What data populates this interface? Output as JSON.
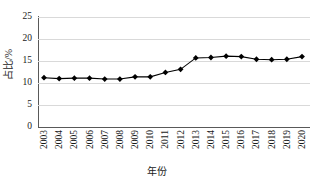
{
  "chart_data": {
    "type": "line",
    "title": "",
    "xlabel": "年份",
    "ylabel": "占比/%",
    "categories": [
      "2003",
      "2004",
      "2005",
      "2006",
      "2007",
      "2008",
      "2009",
      "2010",
      "2011",
      "2012",
      "2013",
      "2014",
      "2015",
      "2016",
      "2017",
      "2018",
      "2019",
      "2020"
    ],
    "values": [
      11.2,
      11.0,
      11.1,
      11.1,
      10.9,
      10.9,
      11.4,
      11.4,
      12.4,
      13.1,
      15.7,
      15.8,
      16.1,
      16.0,
      15.4,
      15.3,
      15.4,
      16.0
    ],
    "series": [
      {
        "name": "占比",
        "values": [
          11.2,
          11.0,
          11.1,
          11.1,
          10.9,
          10.9,
          11.4,
          11.4,
          12.4,
          13.1,
          15.7,
          15.8,
          16.1,
          16.0,
          15.4,
          15.3,
          15.4,
          16.0
        ]
      }
    ],
    "ylim": [
      0,
      25
    ],
    "yticks": [
      0,
      5,
      10,
      15,
      20,
      25
    ],
    "ytick_labels": [
      "0",
      "5",
      "10",
      "15",
      "20",
      "25"
    ],
    "grid": "horizontal",
    "legend": "none",
    "marker": "diamond",
    "line_color": "#000000",
    "marker_color": "#000000",
    "grid_color": "#d9d9d9",
    "axis_color": "#595959"
  }
}
